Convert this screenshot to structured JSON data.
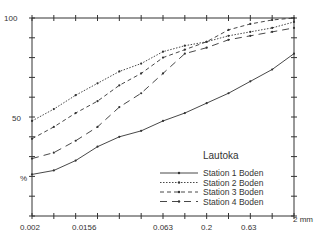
{
  "chart_data": {
    "type": "line",
    "title": "Lautoka",
    "xlabel": "mm",
    "ylabel": "%",
    "x_scale": "log",
    "x_tick_labels": [
      "0.002",
      "0.0156",
      "0.063",
      "0.2",
      "0.63",
      "2 mm"
    ],
    "y_tick_labels": [
      "100",
      "50",
      "%"
    ],
    "ylim": [
      0,
      100
    ],
    "x": [
      0.002,
      0.004,
      0.008,
      0.0156,
      0.031,
      0.063,
      0.125,
      0.2,
      0.25,
      0.5,
      0.63,
      1.0,
      2.0
    ],
    "series": [
      {
        "name": "Station 1 Boden",
        "style": "solid",
        "points": [
          [
            0,
            21
          ],
          [
            1,
            23
          ],
          [
            2,
            28
          ],
          [
            3,
            35
          ],
          [
            4,
            40
          ],
          [
            5,
            43
          ],
          [
            6,
            48
          ],
          [
            7,
            52
          ],
          [
            8,
            57
          ],
          [
            9,
            62
          ],
          [
            10,
            68
          ],
          [
            11,
            74
          ],
          [
            12,
            82
          ]
        ]
      },
      {
        "name": "Station 2 Boden",
        "style": "dotted",
        "points": [
          [
            0,
            48
          ],
          [
            1,
            54
          ],
          [
            2,
            61
          ],
          [
            3,
            67
          ],
          [
            4,
            73
          ],
          [
            5,
            77
          ],
          [
            6,
            83
          ],
          [
            7,
            86
          ],
          [
            8,
            88
          ],
          [
            9,
            91
          ],
          [
            10,
            93
          ],
          [
            11,
            95
          ],
          [
            12,
            98
          ]
        ]
      },
      {
        "name": "Station 3 Boden",
        "style": "dashed",
        "points": [
          [
            0,
            39
          ],
          [
            1,
            45
          ],
          [
            2,
            52
          ],
          [
            3,
            58
          ],
          [
            4,
            66
          ],
          [
            5,
            72
          ],
          [
            6,
            80
          ],
          [
            7,
            84
          ],
          [
            8,
            88
          ],
          [
            9,
            94
          ],
          [
            10,
            97
          ],
          [
            11,
            99
          ],
          [
            12,
            100
          ]
        ]
      },
      {
        "name": "Station 4 Boden",
        "style": "long-dash",
        "points": [
          [
            0,
            29
          ],
          [
            1,
            32
          ],
          [
            2,
            38
          ],
          [
            3,
            45
          ],
          [
            4,
            55
          ],
          [
            5,
            62
          ],
          [
            6,
            72
          ],
          [
            7,
            82
          ],
          [
            8,
            85
          ],
          [
            9,
            89
          ],
          [
            10,
            91
          ],
          [
            11,
            93
          ],
          [
            12,
            95
          ]
        ]
      }
    ],
    "legend_position": "lower right",
    "grid": false
  },
  "labels": {
    "y100": "100",
    "y50": "50",
    "ypct": "%",
    "x0": "0.002",
    "x1": "0.0156",
    "x2": "0.063",
    "x3": "0.2",
    "x4": "0.63",
    "x5": "2 mm",
    "title": "Lautoka",
    "legend": [
      "Station 1 Boden",
      "Station 2 Boden",
      "Station 3 Boden",
      "Station 4 Boden"
    ]
  }
}
